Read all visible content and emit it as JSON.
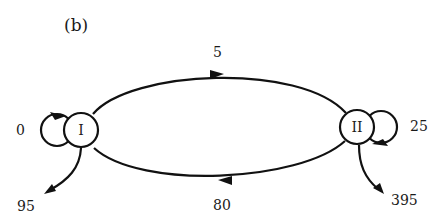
{
  "figure": {
    "panel_label": "(b)",
    "colors": {
      "stroke": "#111111",
      "text": "#1a1a1a",
      "background": "#ffffff"
    }
  },
  "nodes": [
    {
      "id": "I",
      "label": "I"
    },
    {
      "id": "II",
      "label": "II"
    }
  ],
  "edges": [
    {
      "from": "I",
      "to": "II",
      "label": "5",
      "kind": "transition-top"
    },
    {
      "from": "II",
      "to": "I",
      "label": "80",
      "kind": "transition-bottom"
    },
    {
      "from": "I",
      "to": "I",
      "label": "0",
      "kind": "self-loop"
    },
    {
      "from": "II",
      "to": "II",
      "label": "25",
      "kind": "self-loop"
    },
    {
      "from": "I",
      "to": "out",
      "label": "95",
      "kind": "exit"
    },
    {
      "from": "II",
      "to": "out",
      "label": "395",
      "kind": "exit"
    }
  ]
}
